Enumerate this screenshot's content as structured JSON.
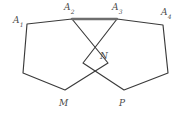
{
  "figure": {
    "background_color": "#ffffff",
    "stroke_color": "#3a3a3a",
    "highlight_stroke_color": "#6e6e6e",
    "label_color": "#4a4a4a",
    "width": 187,
    "height": 116
  },
  "labels": {
    "a1": {
      "base": "A",
      "sub": "1",
      "x": 13,
      "y": 16
    },
    "a2": {
      "base": "A",
      "sub": "2",
      "x": 64,
      "y": 3
    },
    "a3": {
      "base": "A",
      "sub": "3",
      "x": 112,
      "y": 3
    },
    "a4": {
      "base": "A",
      "sub": "4",
      "x": 161,
      "y": 8
    },
    "m": {
      "base": "M",
      "sub": "",
      "x": 59,
      "y": 99
    },
    "n": {
      "base": "N",
      "sub": "",
      "x": 100,
      "y": 52
    },
    "p": {
      "base": "P",
      "sub": "",
      "x": 119,
      "y": 99
    }
  },
  "points": {
    "A1": {
      "x": 27,
      "y": 24
    },
    "A2": {
      "x": 72,
      "y": 19
    },
    "A3": {
      "x": 117,
      "y": 19
    },
    "A4": {
      "x": 163,
      "y": 25
    },
    "N": {
      "x": 95,
      "y": 56
    },
    "M": {
      "x": 65,
      "y": 90
    },
    "P": {
      "x": 124,
      "y": 90
    },
    "L": {
      "x": 23,
      "y": 73
    },
    "R": {
      "x": 168,
      "y": 73
    }
  },
  "paths": {
    "left_pentagon": "M 27,24 L 72,19 L 108,63 L 65,90 L 23,73 Z",
    "right_pentagon": "M 117,19 L 163,25 L 168,73 L 124,90 L 83,63 Z",
    "top_edge": "M 72,19 L 117,19"
  }
}
